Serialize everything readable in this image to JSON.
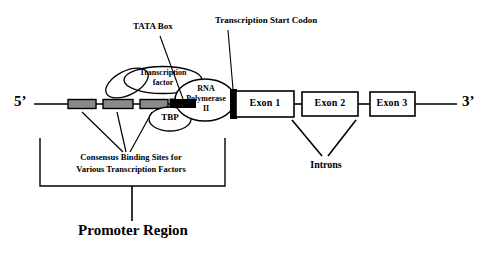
{
  "diagram": {
    "title_bottom": "Promoter Region",
    "strand_labels": {
      "five_prime": "5’",
      "three_prime": "3’"
    },
    "callouts": {
      "tata_box": "TATA Box",
      "transcription_start_codon": "Transcription Start Codon"
    },
    "complex": {
      "transcription_factor_line1": "Transcription",
      "transcription_factor_line2": "factor",
      "tbp": "TBP",
      "rna_pol_line1": "RNA",
      "rna_pol_line2": "Polymerase",
      "rna_pol_line3": "II"
    },
    "exons": [
      {
        "label": "Exon 1"
      },
      {
        "label": "Exon 2"
      },
      {
        "label": "Exon 3"
      }
    ],
    "introns_label": "Introns",
    "consensus": {
      "line1": "Consensus Binding Sites for",
      "line2": "Various Transcription Factors"
    },
    "colors": {
      "stroke": "#000000",
      "binding_site_fill": "#8a8a8a",
      "tata_fill": "#000000",
      "background": "#ffffff",
      "exon_fill": "#ffffff"
    }
  }
}
